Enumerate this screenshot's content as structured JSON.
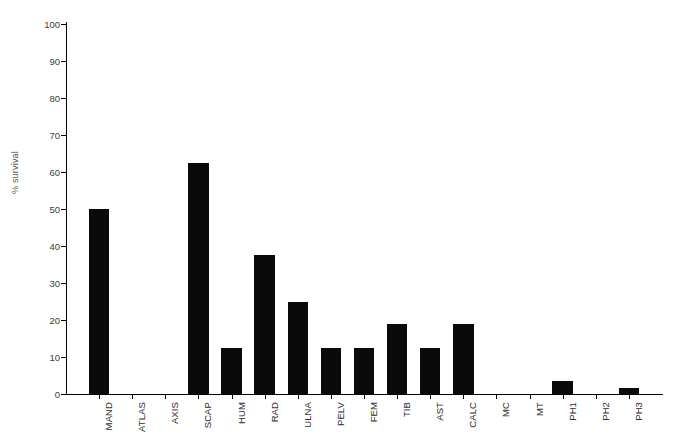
{
  "chart_data": {
    "type": "bar",
    "title": "",
    "xlabel": "",
    "ylabel": "% survival",
    "ylim": [
      0,
      100
    ],
    "yticks": [
      0,
      10,
      20,
      30,
      40,
      50,
      60,
      70,
      80,
      90,
      100
    ],
    "grid": false,
    "legend": null,
    "categories": [
      "MAND",
      "ATLAS",
      "AXIS",
      "SCAP",
      "HUM",
      "RAD",
      "ULNA",
      "PELV",
      "FEM",
      "TIB",
      "AST",
      "CALC",
      "MC",
      "MT",
      "PH1",
      "PH2",
      "PH3"
    ],
    "values": [
      50,
      0,
      0,
      62.5,
      12.5,
      37.5,
      25,
      12.5,
      12.5,
      19,
      12.5,
      19,
      0,
      0,
      3.5,
      0,
      1.7
    ],
    "bar_color": "#0a0a0a"
  }
}
